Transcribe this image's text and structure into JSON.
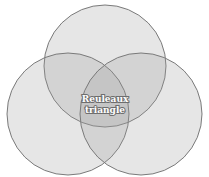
{
  "diagram": {
    "type": "venn",
    "label_line1": "Reuleaux",
    "label_line2": "triangle",
    "circles": [
      {
        "name": "top",
        "cx": 105,
        "cy": 66,
        "r": 61
      },
      {
        "name": "left",
        "cx": 68,
        "cy": 114,
        "r": 61
      },
      {
        "name": "right",
        "cx": 141,
        "cy": 114,
        "r": 61
      }
    ],
    "colors": {
      "fill": "#9a9a9a",
      "fill_opacity": 0.25,
      "stroke": "#7a7a7a",
      "background": "#ffffff"
    }
  }
}
